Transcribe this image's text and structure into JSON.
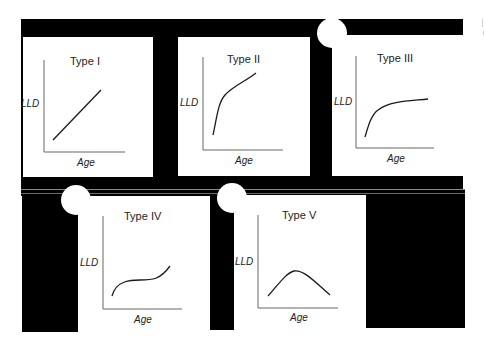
{
  "figure": {
    "panels": [
      {
        "id": "type-i",
        "title": "Type I",
        "ylabel": "LLD",
        "xlabel": "Age",
        "shape": "linear increasing"
      },
      {
        "id": "type-ii",
        "title": "Type II",
        "ylabel": "LLD",
        "xlabel": "Age",
        "shape": "steep rise then slower increase"
      },
      {
        "id": "type-iii",
        "title": "Type III",
        "ylabel": "LLD",
        "xlabel": "Age",
        "shape": "rapid rise then plateau"
      },
      {
        "id": "type-iv",
        "title": "Type IV",
        "ylabel": "LLD",
        "xlabel": "Age",
        "shape": "rise, plateau, rise (sigmoid-like)"
      },
      {
        "id": "type-v",
        "title": "Type V",
        "ylabel": "LLD",
        "xlabel": "Age",
        "shape": "rise then decline (peak)"
      }
    ]
  },
  "colors": {
    "frame": "#000000",
    "panel_bg": "#ffffff",
    "curve": "#1a1a1a",
    "axis": "#555555"
  }
}
